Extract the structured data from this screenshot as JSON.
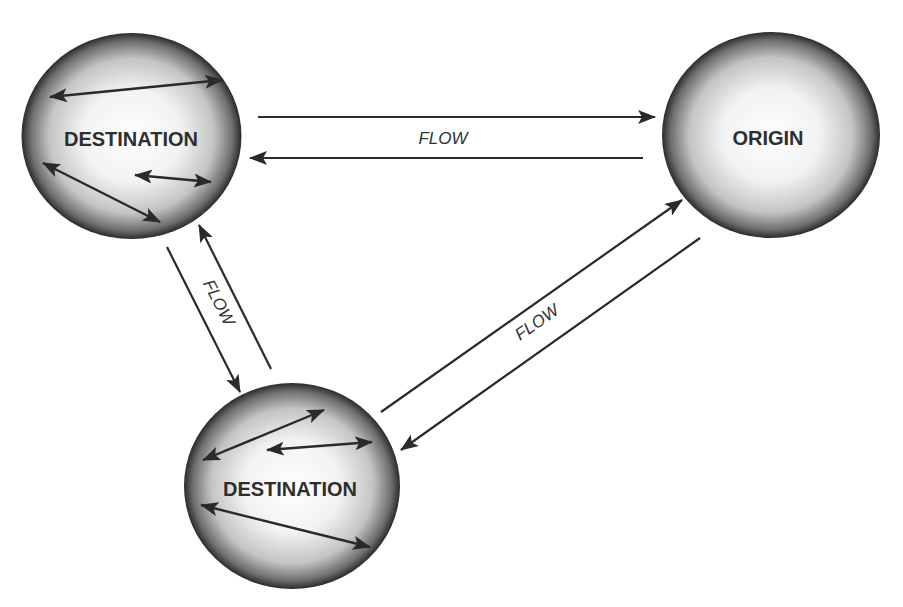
{
  "diagram": {
    "type": "flow-network",
    "colors": {
      "background": "#ffffff",
      "node_center": "#ffffff",
      "node_edge": "#2b2b2b",
      "arrow": "#2a2a2a",
      "text": "#2e2e2e"
    },
    "nodes": [
      {
        "id": "destination-top",
        "label": "DESTINATION",
        "internal_arrows": 3
      },
      {
        "id": "origin",
        "label": "ORIGIN",
        "internal_arrows": 0
      },
      {
        "id": "destination-bottom",
        "label": "DESTINATION",
        "internal_arrows": 3
      }
    ],
    "edges": [
      {
        "between": [
          "origin",
          "destination-top"
        ],
        "label": "FLOW",
        "bidirectional": true
      },
      {
        "between": [
          "destination-top",
          "destination-bottom"
        ],
        "label": "FLOW",
        "bidirectional": true
      },
      {
        "between": [
          "destination-bottom",
          "origin"
        ],
        "label": "FLOW",
        "bidirectional": true
      }
    ]
  }
}
